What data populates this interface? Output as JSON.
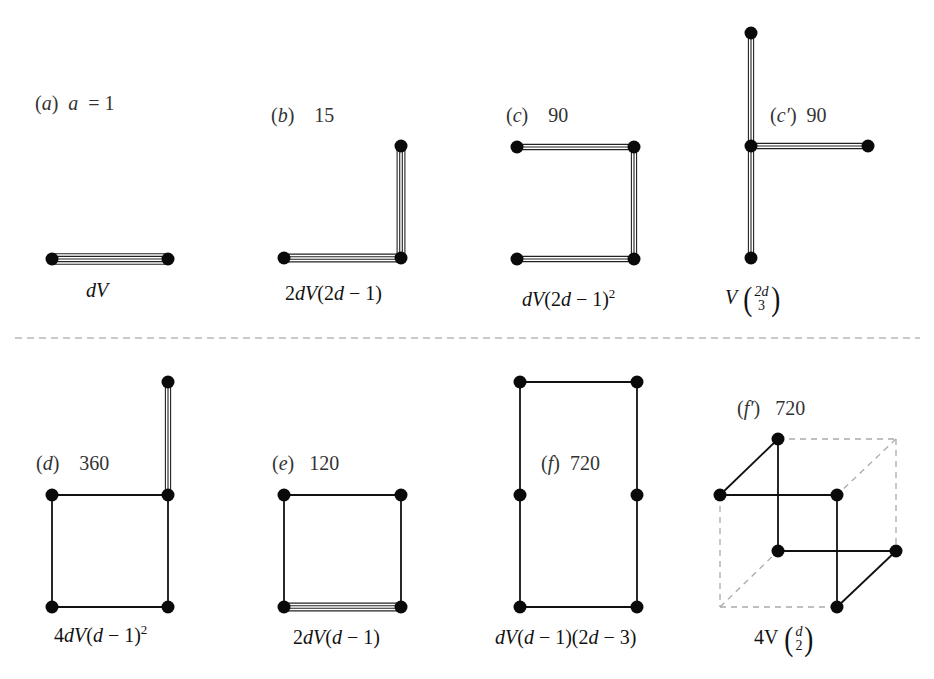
{
  "divider": {
    "y": 338,
    "style": "dashed",
    "color": "#b8b8b8"
  },
  "panels": [
    {
      "id": "a",
      "tag": "(a)",
      "tag_letter": "a",
      "count": "a = 1",
      "label_pos": [
        35,
        92
      ],
      "formula": "dV",
      "formula_pos": [
        86,
        279
      ],
      "nodes": [
        [
          52,
          259
        ],
        [
          168,
          259
        ]
      ],
      "edges": [
        {
          "from": 0,
          "to": 1,
          "mult": 4
        }
      ]
    },
    {
      "id": "b",
      "tag": "(b)",
      "tag_letter": "b",
      "count": "15",
      "label_pos": [
        271,
        104
      ],
      "formula": "2dV(2d − 1)",
      "formula_pos": [
        285,
        282
      ],
      "nodes": [
        [
          284,
          258
        ],
        [
          401,
          258
        ],
        [
          401,
          146
        ]
      ],
      "edges": [
        {
          "from": 0,
          "to": 1,
          "mult": 3
        },
        {
          "from": 1,
          "to": 2,
          "mult": 3
        }
      ]
    },
    {
      "id": "c",
      "tag": "(c)",
      "tag_letter": "c",
      "count": "90",
      "label_pos": [
        506,
        104
      ],
      "formula_main": "dV(2d − 1)",
      "formula_sup": "2",
      "formula_pos": [
        522,
        286
      ],
      "nodes": [
        [
          517,
          147
        ],
        [
          634,
          147
        ],
        [
          634,
          259
        ],
        [
          517,
          259
        ]
      ],
      "edges": [
        {
          "from": 0,
          "to": 1,
          "mult": 2
        },
        {
          "from": 1,
          "to": 2,
          "mult": 2
        },
        {
          "from": 2,
          "to": 3,
          "mult": 2
        }
      ]
    },
    {
      "id": "c-prime",
      "tag": "(c′)",
      "tag_letter": "c′",
      "count": "90",
      "label_pos": [
        770,
        104
      ],
      "formula_V": "V",
      "formula_top": "2d",
      "formula_bottom": "3",
      "formula_pos": [
        725,
        282
      ],
      "nodes": [
        [
          751,
          33
        ],
        [
          751,
          146
        ],
        [
          868,
          146
        ],
        [
          751,
          258
        ]
      ],
      "edges": [
        {
          "from": 0,
          "to": 1,
          "mult": 2
        },
        {
          "from": 1,
          "to": 2,
          "mult": 2
        },
        {
          "from": 1,
          "to": 3,
          "mult": 2
        }
      ]
    },
    {
      "id": "d",
      "tag": "(d)",
      "tag_letter": "d",
      "count": "360",
      "label_pos": [
        36,
        452
      ],
      "formula_main": "4dV(d − 1)",
      "formula_sup": "2",
      "formula_pos": [
        54,
        622
      ],
      "nodes": [
        [
          168,
          382
        ],
        [
          168,
          495
        ],
        [
          52,
          495
        ],
        [
          52,
          607
        ],
        [
          168,
          607
        ]
      ],
      "edges": [
        {
          "from": 0,
          "to": 1,
          "mult": 2
        },
        {
          "from": 1,
          "to": 2,
          "mult": 1
        },
        {
          "from": 2,
          "to": 3,
          "mult": 1
        },
        {
          "from": 3,
          "to": 4,
          "mult": 1
        },
        {
          "from": 4,
          "to": 1,
          "mult": 1
        }
      ]
    },
    {
      "id": "e",
      "tag": "(e)",
      "tag_letter": "e",
      "count": "120",
      "label_pos": [
        272,
        452
      ],
      "formula": "2dV(d − 1)",
      "formula_pos": [
        293,
        626
      ],
      "nodes": [
        [
          284,
          495
        ],
        [
          401,
          495
        ],
        [
          401,
          607
        ],
        [
          284,
          607
        ]
      ],
      "edges": [
        {
          "from": 0,
          "to": 1,
          "mult": 1
        },
        {
          "from": 1,
          "to": 2,
          "mult": 1
        },
        {
          "from": 2,
          "to": 3,
          "mult": 3
        },
        {
          "from": 3,
          "to": 0,
          "mult": 1
        }
      ]
    },
    {
      "id": "f",
      "tag": "(f)",
      "tag_letter": "f",
      "count": "720",
      "label_pos": [
        541,
        452
      ],
      "formula": "dV(d − 1)(2d − 3)",
      "formula_pos": [
        495,
        626
      ],
      "nodes": [
        [
          520,
          382
        ],
        [
          637,
          382
        ],
        [
          637,
          495
        ],
        [
          637,
          607
        ],
        [
          520,
          607
        ],
        [
          520,
          495
        ]
      ],
      "edges": [
        {
          "from": 0,
          "to": 1,
          "mult": 1
        },
        {
          "from": 1,
          "to": 2,
          "mult": 1
        },
        {
          "from": 2,
          "to": 3,
          "mult": 1
        },
        {
          "from": 3,
          "to": 4,
          "mult": 1
        },
        {
          "from": 4,
          "to": 5,
          "mult": 1
        },
        {
          "from": 5,
          "to": 0,
          "mult": 1
        }
      ]
    },
    {
      "id": "f-prime",
      "tag": "(f′)",
      "tag_letter": "f′",
      "count": "720",
      "label_pos": [
        737,
        397
      ],
      "formula_V": "4V",
      "formula_top": "d",
      "formula_bottom": "2",
      "formula_pos": [
        754,
        622
      ],
      "nodes": [
        [
          778,
          439
        ],
        [
          720,
          495
        ],
        [
          837,
          495
        ],
        [
          778,
          551
        ],
        [
          896,
          551
        ],
        [
          837,
          607
        ]
      ],
      "edges": [
        {
          "from": 0,
          "to": 1,
          "mult": 1
        },
        {
          "from": 1,
          "to": 2,
          "mult": 1
        },
        {
          "from": 0,
          "to": 3,
          "mult": 1
        },
        {
          "from": 3,
          "to": 4,
          "mult": 1
        },
        {
          "from": 2,
          "to": 5,
          "mult": 1
        },
        {
          "from": 5,
          "to": 4,
          "mult": 1
        }
      ],
      "cube_dashed": [
        [
          [
            778,
            439
          ],
          [
            896,
            439
          ]
        ],
        [
          [
            896,
            439
          ],
          [
            896,
            551
          ]
        ],
        [
          [
            896,
            439
          ],
          [
            837,
            495
          ]
        ],
        [
          [
            720,
            495
          ],
          [
            720,
            607
          ]
        ],
        [
          [
            720,
            607
          ],
          [
            837,
            607
          ]
        ],
        [
          [
            720,
            607
          ],
          [
            778,
            551
          ]
        ]
      ]
    }
  ]
}
